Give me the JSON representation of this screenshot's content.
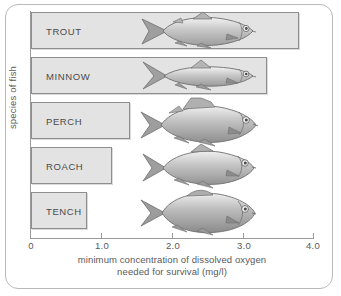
{
  "chart_data": {
    "type": "bar",
    "orientation": "horizontal",
    "title": "",
    "xlabel": "minimum concentration of dissolved oxygen needed for survival (mg/l)",
    "xlabel_line1": "minimum concentration of dissolved oxygen",
    "xlabel_line2": "needed for survival (mg/l)",
    "ylabel": "species of fish",
    "categories": [
      "TROUT",
      "MINNOW",
      "PERCH",
      "ROACH",
      "TENCH"
    ],
    "values": [
      3.8,
      3.35,
      1.4,
      1.15,
      0.8
    ],
    "xlim": [
      0,
      4.0
    ],
    "xticks": [
      0,
      1.0,
      2.0,
      3.0,
      4.0
    ],
    "xtick_labels": [
      "0",
      "1.0",
      "2.0",
      "3.0",
      "4.0"
    ],
    "grid": false,
    "legend": null,
    "bar_fill_color": "#e3e3e3",
    "bar_border_color": "#8e8e8e",
    "axis_color": "#9a9a9a",
    "text_color": "#59595b"
  },
  "bars": [
    {
      "label": "TROUT",
      "value": 3.8,
      "fish": "trout-illustration"
    },
    {
      "label": "MINNOW",
      "value": 3.35,
      "fish": "minnow-illustration"
    },
    {
      "label": "PERCH",
      "value": 1.4,
      "fish": "perch-illustration"
    },
    {
      "label": "ROACH",
      "value": 1.15,
      "fish": "roach-illustration"
    },
    {
      "label": "TENCH",
      "value": 0.8,
      "fish": "tench-illustration"
    }
  ],
  "axis": {
    "y_title": "species of fish",
    "x_title_line1": "minimum concentration of dissolved oxygen",
    "x_title_line2": "needed for survival (mg/l)",
    "ticks": [
      "0",
      "1.0",
      "2.0",
      "3.0",
      "4.0"
    ]
  }
}
